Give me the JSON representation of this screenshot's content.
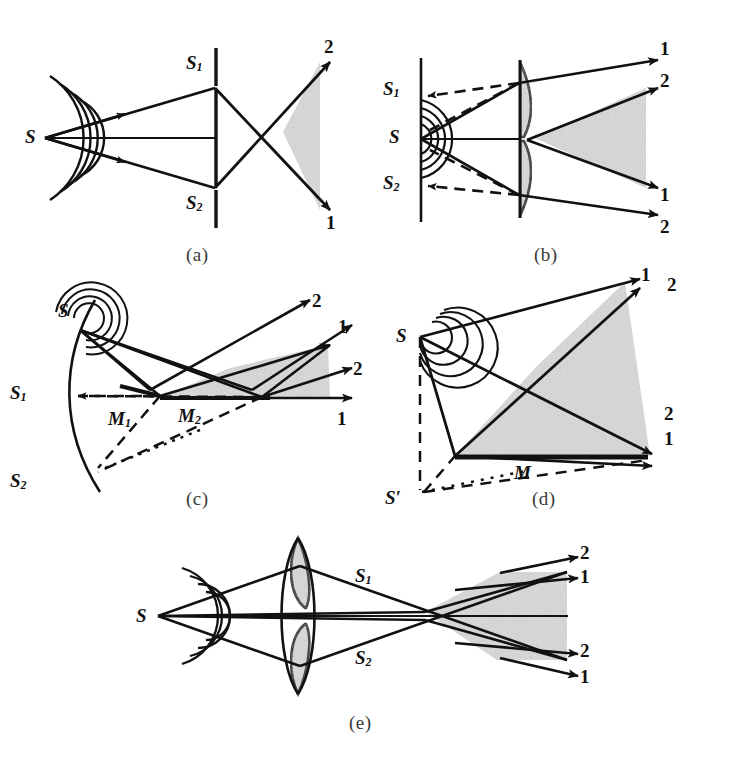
{
  "figure": {
    "background_color": "#ffffff",
    "ink_color": "#111111",
    "shade_color": "#d9d9d9",
    "panel_captions": [
      "(a)",
      "(b)",
      "(c)",
      "(d)",
      "(e)"
    ]
  },
  "panels": [
    {
      "id": "a",
      "caption": "(a)",
      "name": "young-double-slit",
      "labels": {
        "source": "S",
        "slit_top": "S",
        "slit_top_sub": "1",
        "slit_bottom": "S",
        "slit_bottom_sub": "2",
        "beam_upper": "2",
        "beam_lower": "1"
      }
    },
    {
      "id": "b",
      "caption": "(b)",
      "name": "billet-split-lens-virtual-sources",
      "labels": {
        "source": "S",
        "virtual_top": "S",
        "virtual_top_sub": "1",
        "virtual_bottom": "S",
        "virtual_bottom_sub": "2",
        "beam_1a": "1",
        "beam_2a": "2",
        "beam_1b": "1",
        "beam_2b": "2"
      }
    },
    {
      "id": "c",
      "caption": "(c)",
      "name": "fresnel-double-mirror",
      "labels": {
        "source": "S",
        "image_top": "S",
        "image_top_sub": "1",
        "image_bottom": "S",
        "image_bottom_sub": "2",
        "mirror_1": "M",
        "mirror_1_sub": "1",
        "mirror_2": "M",
        "mirror_2_sub": "2",
        "beam_2_top": "2",
        "beam_1_top": "1",
        "beam_2_right": "2",
        "beam_1_right": "1"
      }
    },
    {
      "id": "d",
      "caption": "(d)",
      "name": "lloyds-mirror",
      "labels": {
        "source": "S",
        "mirror": "M",
        "image_source": "S′",
        "beam_1_top": "1",
        "beam_2_top": "2",
        "beam_2_right": "2",
        "beam_1_right": "1"
      }
    },
    {
      "id": "e",
      "caption": "(e)",
      "name": "billet-bi-lens",
      "labels": {
        "source": "S",
        "image_top": "S",
        "image_top_sub": "1",
        "image_bottom": "S",
        "image_bottom_sub": "2",
        "beam_2_top": "2",
        "beam_1_top": "1",
        "beam_2_bottom": "2",
        "beam_1_bottom": "1"
      }
    }
  ]
}
